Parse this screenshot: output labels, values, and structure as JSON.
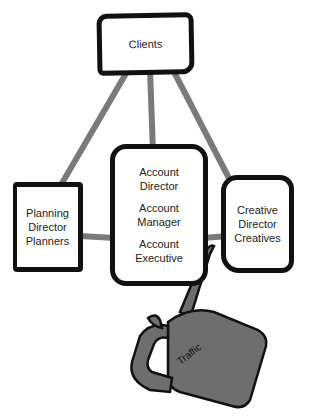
{
  "diagram": {
    "nodes": {
      "clients": {
        "label": "Clients"
      },
      "account": {
        "lines": [
          "Account Director",
          "Account Manager",
          "Account Executive"
        ],
        "line1a": "Account",
        "line1b": "Director",
        "line2a": "Account",
        "line2b": "Manager",
        "line3a": "Account",
        "line3b": "Executive"
      },
      "planning": {
        "line1": "Planning",
        "line2": "Director",
        "line3": "Planners"
      },
      "creative": {
        "line1": "Creative",
        "line2": "Director",
        "line3": "Creatives"
      },
      "traffic": {
        "label": "Traffic"
      }
    },
    "edges": [
      [
        "clients",
        "planning"
      ],
      [
        "clients",
        "account"
      ],
      [
        "clients",
        "creative"
      ],
      [
        "planning",
        "account"
      ],
      [
        "account",
        "creative"
      ]
    ],
    "colors": {
      "border": "#111111",
      "connector": "#7a7a7a",
      "oilcan": "#6e6e6e"
    }
  }
}
